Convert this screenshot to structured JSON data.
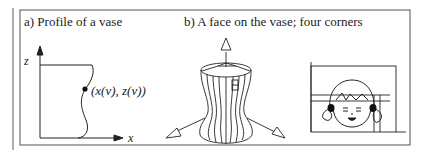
{
  "panel_a": {
    "title": "a) Profile of a vase",
    "z_axis_label": "z",
    "x_axis_label": "x",
    "point_label": "(x(v), z(v))"
  },
  "panel_b": {
    "title": "b) A face on the vase; four corners"
  },
  "colors": {
    "line": "#222222",
    "frame": "#555555",
    "background": "#ffffff"
  }
}
